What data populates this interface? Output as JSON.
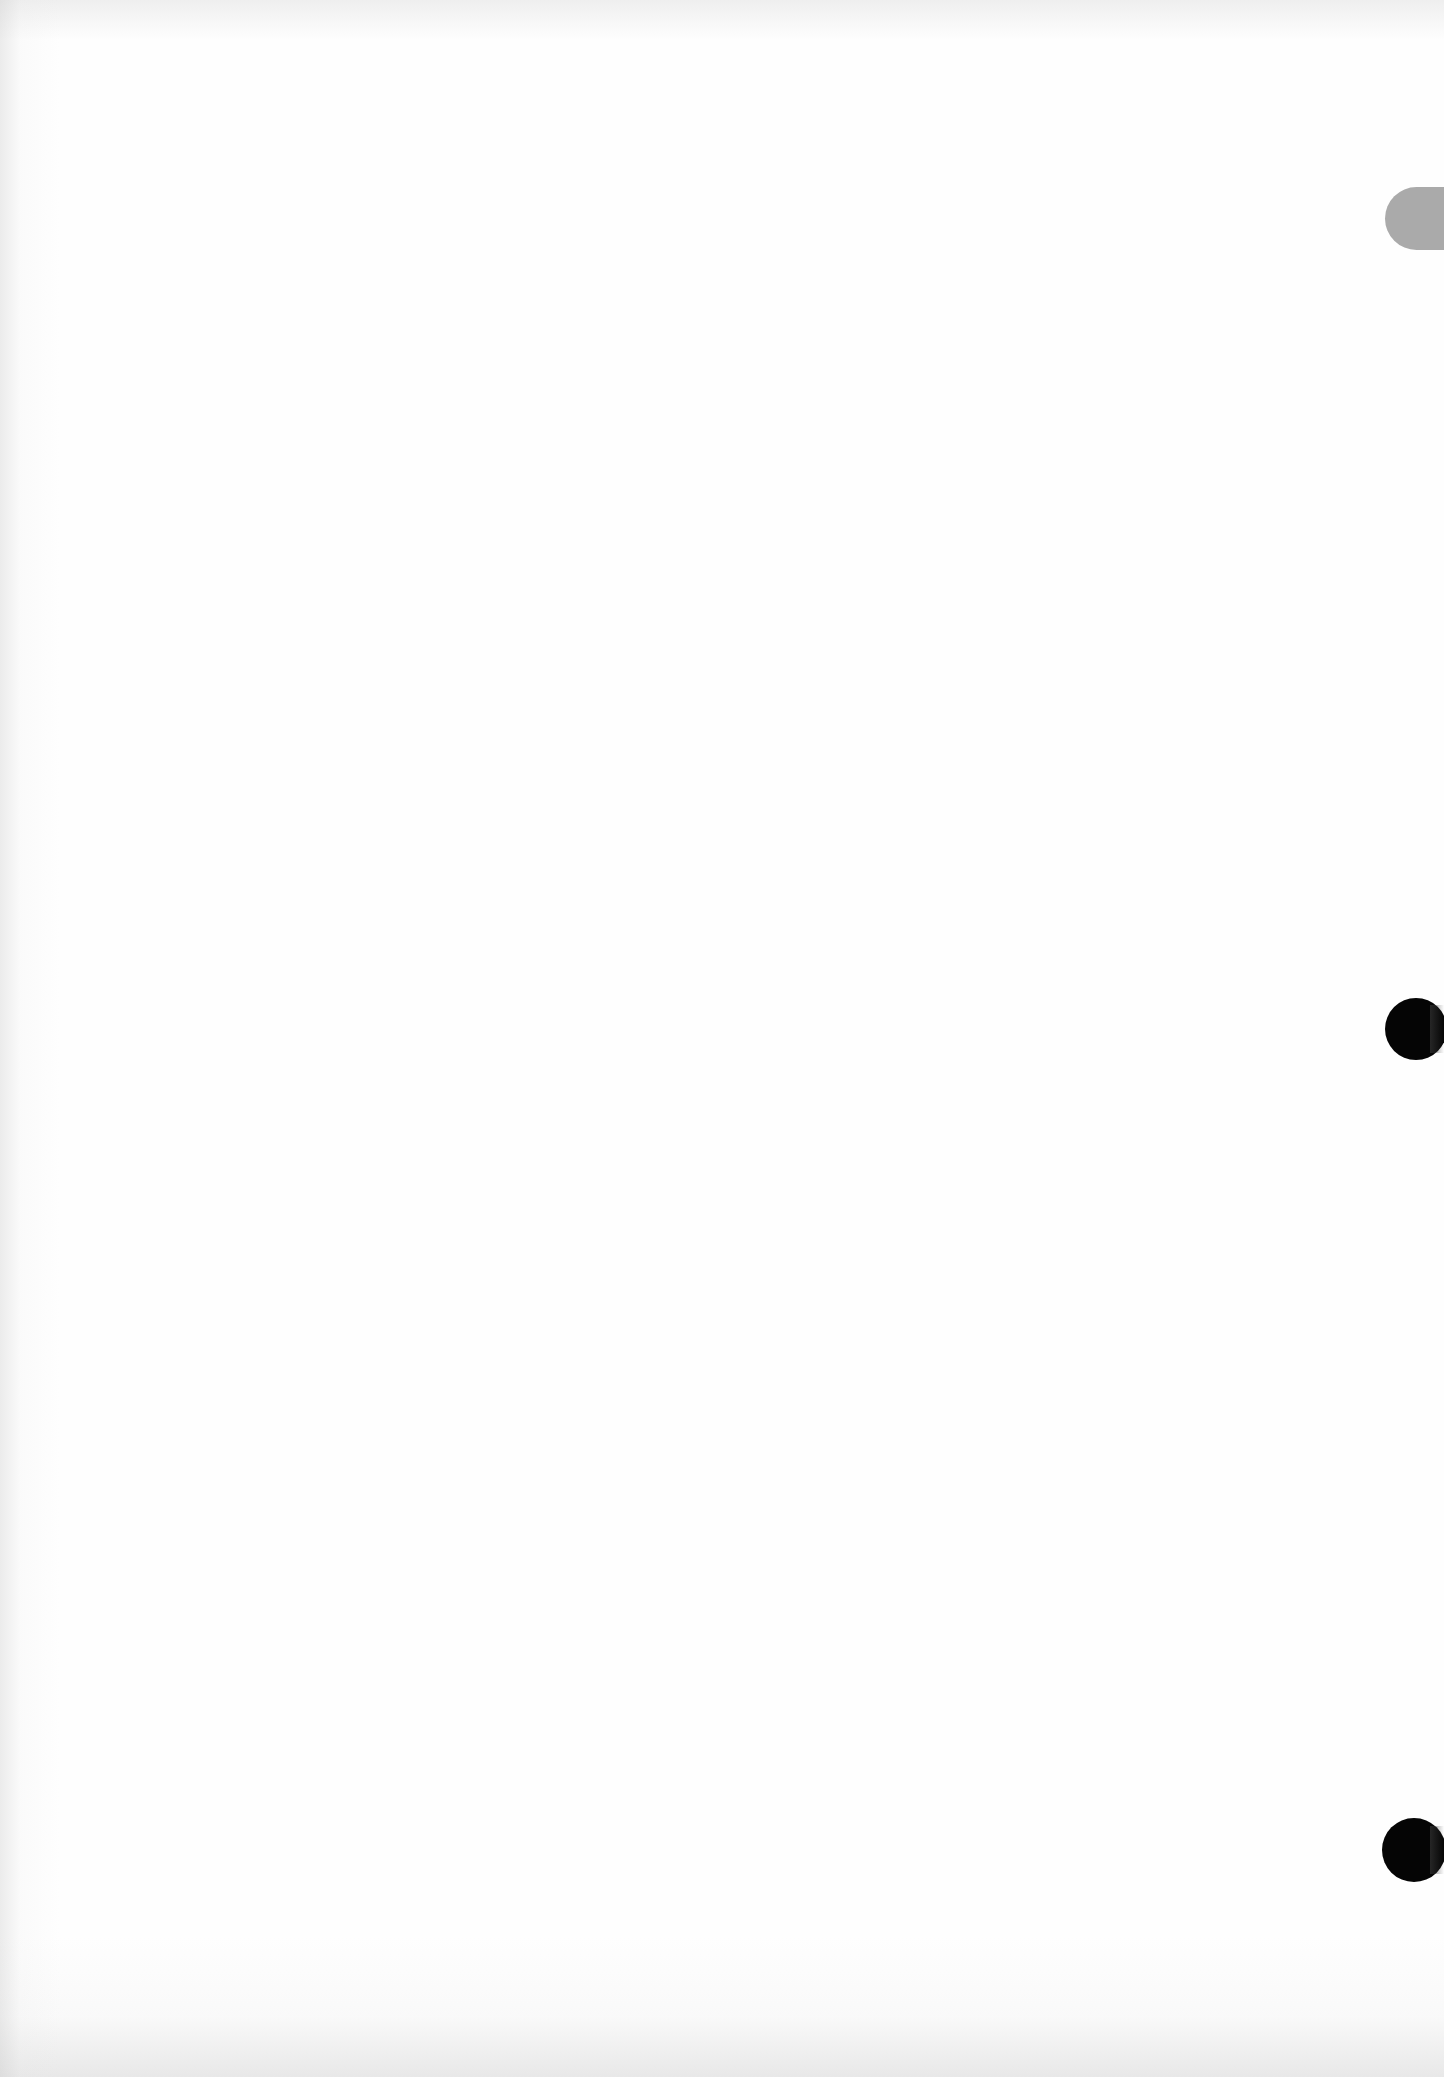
{
  "page": {
    "type": "blank scanned page",
    "background_color": "#fefefe"
  },
  "marks": {
    "tab": {
      "color": "#aaaaaa",
      "position": "right-edge-top"
    },
    "punch_holes": [
      {
        "color": "#050505",
        "position": "right-edge-middle"
      },
      {
        "color": "#050505",
        "position": "right-edge-bottom"
      }
    ]
  }
}
